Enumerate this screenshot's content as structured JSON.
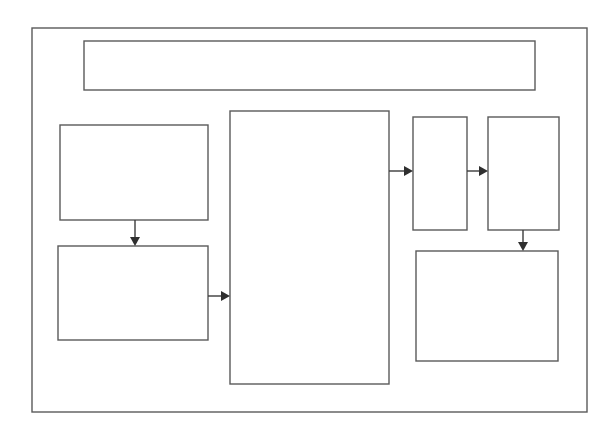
{
  "diagram": {
    "type": "block-flow",
    "colors": {
      "background": "#ffffff",
      "stroke": "#5a5a5a",
      "arrow": "#2f2f2f"
    },
    "frame": {
      "x": 32,
      "y": 28,
      "w": 555,
      "h": 384,
      "label": ""
    },
    "nodes": [
      {
        "id": "banner",
        "x": 84,
        "y": 41,
        "w": 451,
        "h": 49,
        "label": ""
      },
      {
        "id": "left-top",
        "x": 60,
        "y": 125,
        "w": 148,
        "h": 95,
        "label": ""
      },
      {
        "id": "left-bottom",
        "x": 58,
        "y": 246,
        "w": 150,
        "h": 94,
        "label": ""
      },
      {
        "id": "center",
        "x": 230,
        "y": 111,
        "w": 159,
        "h": 273,
        "label": ""
      },
      {
        "id": "narrow",
        "x": 413,
        "y": 117,
        "w": 54,
        "h": 113,
        "label": ""
      },
      {
        "id": "right-top",
        "x": 488,
        "y": 117,
        "w": 71,
        "h": 113,
        "label": ""
      },
      {
        "id": "right-bottom",
        "x": 416,
        "y": 251,
        "w": 142,
        "h": 110,
        "label": ""
      }
    ],
    "edges": [
      {
        "from": "left-top",
        "to": "left-bottom",
        "direction": "down"
      },
      {
        "from": "left-bottom",
        "to": "center",
        "direction": "right"
      },
      {
        "from": "center",
        "to": "narrow",
        "direction": "right"
      },
      {
        "from": "narrow",
        "to": "right-top",
        "direction": "right"
      },
      {
        "from": "right-top",
        "to": "right-bottom",
        "direction": "down"
      }
    ]
  }
}
